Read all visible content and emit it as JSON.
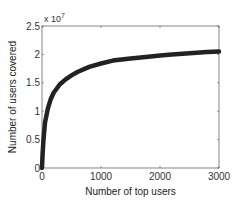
{
  "chart_data": {
    "type": "line",
    "title": "",
    "xlabel": "Number of top users",
    "ylabel": "Number of users covered",
    "xlim": [
      0,
      3000
    ],
    "ylim": [
      0,
      2.5
    ],
    "y_multiplier": "x 10^7",
    "y_multiplier_base": "x 10",
    "y_multiplier_exp": "7",
    "xticks": [
      0,
      1000,
      2000,
      3000
    ],
    "xtick_labels": [
      "0",
      "1000",
      "2000",
      "3000"
    ],
    "yticks": [
      0,
      0.5,
      1,
      1.5,
      2,
      2.5
    ],
    "ytick_labels": [
      "0",
      "0.5",
      "1",
      "1.5",
      "2",
      "2.5"
    ],
    "grid": false,
    "legend": null,
    "series": [
      {
        "name": "coverage",
        "color": "#222222",
        "x": [
          0,
          10,
          25,
          50,
          100,
          150,
          200,
          250,
          300,
          400,
          500,
          600,
          800,
          1000,
          1200,
          1500,
          1800,
          2000,
          2200,
          2500,
          2800,
          3000
        ],
        "y": [
          0.0,
          0.25,
          0.5,
          0.8,
          1.05,
          1.22,
          1.33,
          1.4,
          1.47,
          1.56,
          1.63,
          1.69,
          1.78,
          1.84,
          1.89,
          1.93,
          1.96,
          1.98,
          2.0,
          2.02,
          2.04,
          2.05
        ]
      }
    ]
  },
  "plot_box": {
    "left": 42,
    "top": 26,
    "right": 219,
    "bottom": 168
  }
}
